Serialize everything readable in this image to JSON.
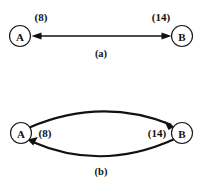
{
  "figure": {
    "width": 205,
    "height": 185,
    "background": "#ffffff",
    "ink_color": "#111111"
  },
  "panels": [
    {
      "id": "panel-a",
      "caption": "(a)",
      "description": "Single undirected edge drawn as a double-headed straight arrow between nodes A and B",
      "nodes": [
        {
          "id": "A",
          "label": "A",
          "cx": 20,
          "cy": 36,
          "r": 10.5
        },
        {
          "id": "B",
          "label": "B",
          "cx": 182,
          "cy": 36,
          "r": 10.5
        }
      ],
      "edges": [
        {
          "id": "edge-a",
          "from": "A",
          "to": "B",
          "style": "straight",
          "arrowheads": "both",
          "labels": [
            {
              "text": "(8)",
              "x": 41,
              "y": 17
            },
            {
              "text": "(14)",
              "x": 161,
              "y": 17
            }
          ]
        }
      ]
    },
    {
      "id": "panel-b",
      "caption": "(b)",
      "description": "Two opposed curved directed edges between nodes A and B forming a lens shape",
      "nodes": [
        {
          "id": "A",
          "label": "A",
          "cx": 21,
          "cy": 133,
          "r": 10.5
        },
        {
          "id": "B",
          "label": "B",
          "cx": 182,
          "cy": 133,
          "r": 10.5
        }
      ],
      "edges": [
        {
          "id": "edge-b-top",
          "from": "A",
          "to": "B",
          "style": "curved-up",
          "arrowheads": "end",
          "labels": [
            {
              "text": "(8)",
              "x": 45,
              "y": 133
            }
          ]
        },
        {
          "id": "edge-b-bottom",
          "from": "B",
          "to": "A",
          "style": "curved-down",
          "arrowheads": "end",
          "labels": [
            {
              "text": "(14)",
              "x": 157,
              "y": 133
            }
          ]
        }
      ]
    }
  ],
  "captions": {
    "a": {
      "text": "(a)",
      "x": 101,
      "y": 53
    },
    "b": {
      "text": "(b)",
      "x": 101,
      "y": 171
    }
  },
  "weights": {
    "a_left": "(8)",
    "a_right": "(14)",
    "b_left": "(8)",
    "b_right": "(14)"
  },
  "node_names": {
    "a_left": "A",
    "a_right": "B",
    "b_left": "A",
    "b_right": "B"
  }
}
